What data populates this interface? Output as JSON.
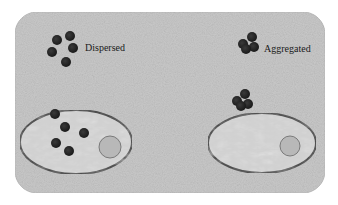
{
  "figure": {
    "background_color": "#c9c9c9",
    "panel_border_color": "#bdbdbd",
    "particle_color": "#262626",
    "cell_fill": "#d0d0d0",
    "cell_border": "#4a4a4a",
    "nucleus_fill": "#b8b8b8",
    "nucleus_border": "#7a7a7a"
  },
  "labels": {
    "dispersed": "Dispersed",
    "aggregated": "Aggregated"
  },
  "panels": [
    {
      "id": "dispersed",
      "label_key": "dispersed",
      "free_particles": [
        [
          57,
          40
        ],
        [
          70,
          36
        ],
        [
          73,
          48
        ],
        [
          52,
          52
        ],
        [
          66,
          62
        ]
      ],
      "cell": {
        "cx": 76,
        "cy": 142,
        "rx": 56,
        "ry": 32
      },
      "nucleus": {
        "cx": 110,
        "cy": 147,
        "r": 11
      },
      "cell_particles": [
        [
          55,
          114
        ],
        [
          65,
          127
        ],
        [
          84,
          133
        ],
        [
          56,
          143
        ],
        [
          69,
          151
        ]
      ]
    },
    {
      "id": "aggregated",
      "label_key": "aggregated",
      "free_particles": [
        [
          243,
          44
        ],
        [
          252,
          37
        ],
        [
          254,
          47
        ],
        [
          246,
          49
        ]
      ],
      "cell": {
        "cx": 262,
        "cy": 143,
        "rx": 54,
        "ry": 30
      },
      "nucleus": {
        "cx": 290,
        "cy": 146,
        "r": 10
      },
      "cell_particles": [
        [
          237,
          101
        ],
        [
          245,
          94
        ],
        [
          248,
          104
        ],
        [
          241,
          106
        ]
      ]
    }
  ]
}
